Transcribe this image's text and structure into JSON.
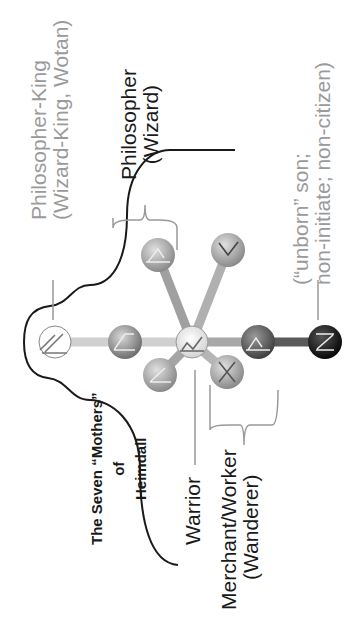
{
  "diagram": {
    "title": {
      "line1": "The Seven “Mothers”",
      "line2": "of",
      "line3": "Heimdall"
    },
    "labels": {
      "philosopher_king": {
        "line1": "Philosopher-King",
        "line2": "(Wizard-King, Wotan)"
      },
      "philosopher": {
        "line1": "Philosopher",
        "line2": "(Wizard)"
      },
      "warrior": "Warrior",
      "merchant": {
        "line1": "Merchant/Worker",
        "line2": "(Wanderer)"
      },
      "unborn": {
        "line1": "(“unborn” son;",
        "line2": "non-initiate; non-citizen)"
      }
    },
    "nodes": [
      {
        "id": "head",
        "rune": "wunjo-slash",
        "fill": "#ffffff"
      },
      {
        "id": "upper-spine",
        "rune": "slanted",
        "fill": "#8a8a8a"
      },
      {
        "id": "center",
        "rune": "zigzag",
        "fill": "#e6e6e6"
      },
      {
        "id": "lower-spine",
        "rune": "triangle",
        "fill": "#6a6a6a"
      },
      {
        "id": "root",
        "rune": "z",
        "fill": "#1a1a1a"
      },
      {
        "id": "upper-left-arm",
        "rune": "triangle",
        "fill": "#9a9a9a"
      },
      {
        "id": "upper-right-arm",
        "rune": "v",
        "fill": "#a8a8a8"
      },
      {
        "id": "lower-left-arm",
        "rune": "angle",
        "fill": "#959595"
      },
      {
        "id": "lower-right-arm",
        "rune": "x",
        "fill": "#a0a0a0"
      }
    ]
  }
}
